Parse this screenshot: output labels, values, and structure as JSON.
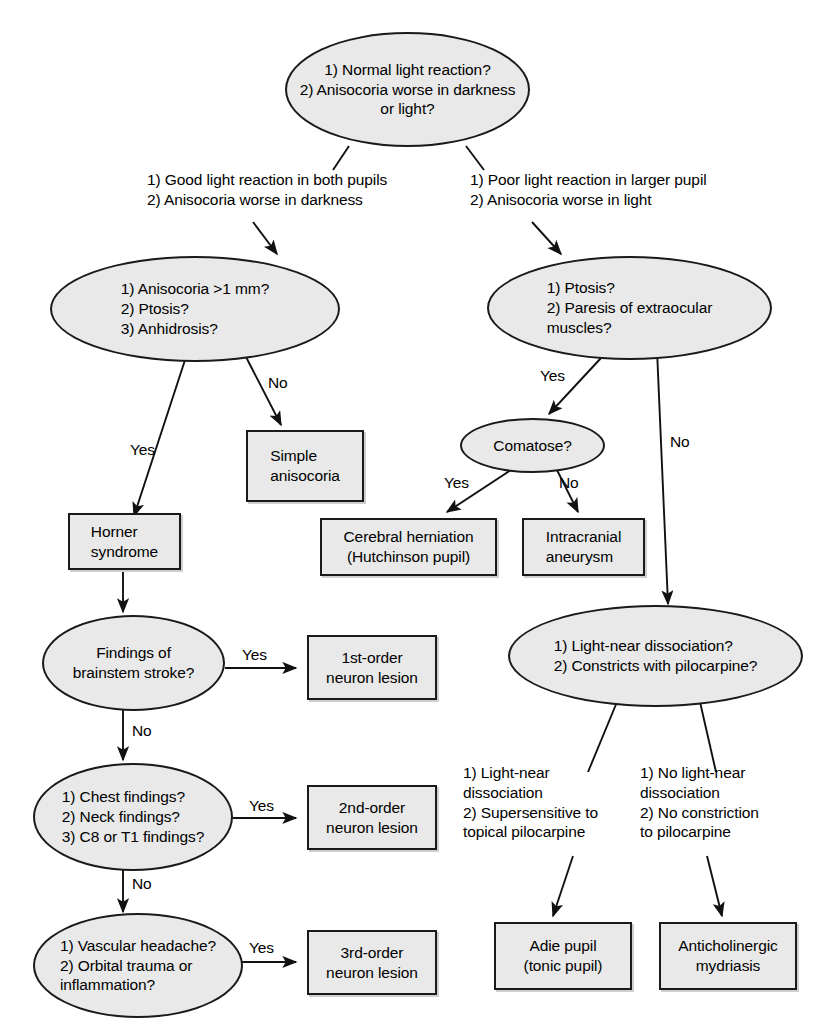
{
  "diagram": {
    "background_color": "#ffffff",
    "node_fill_color": "#e9e9e9",
    "node_border_color": "#1a1a1a",
    "text_color": "#000000"
  },
  "nodes": {
    "root_question": "1) Normal light reaction?\n2) Anisocoria worse in darkness\n      or light?",
    "left_question": "1) Anisocoria >1 mm?\n2) Ptosis?\n3) Anhidrosis?",
    "right_question": "1) Ptosis?\n2) Paresis of extraocular\n      muscles?",
    "simple_anisocoria": "Simple\nanisocoria",
    "comatose": "Comatose?",
    "cerebral_herniation": "Cerebral herniation\n(Hutchinson pupil)",
    "intracranial_aneurysm": "Intracranial\naneurysm",
    "horner_syndrome": "Horner\nsyndrome",
    "brainstem_stroke": "Findings of\nbrainstem stroke?",
    "first_order_lesion": "1st-order\nneuron lesion",
    "chest_neck_findings": "1) Chest findings?\n2) Neck findings?\n3) C8 or T1 findings?",
    "second_order_lesion": "2nd-order\nneuron lesion",
    "vascular_headache": "1) Vascular headache?\n2) Orbital trauma or\n      inflammation?",
    "third_order_lesion": "3rd-order\nneuron lesion",
    "light_near_question": "1) Light-near dissociation?\n2) Constricts with pilocarpine?",
    "adie_pupil": "Adie pupil\n(tonic pupil)",
    "anticholinergic_mydriasis": "Anticholinergic\nmydriasis"
  },
  "edge_labels": {
    "root_left": "1) Good light reaction in both pupils\n2) Anisocoria worse in darkness",
    "root_right": "1) Poor light reaction in larger pupil\n2) Anisocoria worse in light",
    "left_yes": "Yes",
    "left_no": "No",
    "right_yes": "Yes",
    "right_no": "No",
    "comatose_yes": "Yes",
    "comatose_no": "No",
    "stroke_yes": "Yes",
    "stroke_no": "No",
    "chest_yes": "Yes",
    "chest_no": "No",
    "vascular_yes": "Yes",
    "lnd_left": "1) Light-near\n      dissociation\n2) Supersensitive to\n      topical pilocarpine",
    "lnd_right": "1) No light-near\n      dissociation\n2) No constriction\n      to pilocarpine"
  }
}
